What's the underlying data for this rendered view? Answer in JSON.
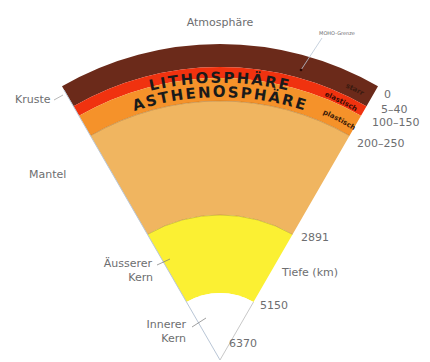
{
  "colors": {
    "crust_starr": "#6b2a1a",
    "elastisch": "#f0320f",
    "asthenosphere": "#f5922a",
    "mantel": "#f0b560",
    "outer_core": "#fbf033",
    "inner_core": "#ffffff",
    "label": "#6d6e70",
    "edge_line": "#b9c6d6"
  },
  "labels": {
    "atmosphere": "Atmosphäre",
    "moho": "MOHO-Grenze",
    "lithosphere": "LITHOSPHÄRE",
    "asthenosphere": "ASTHENOSPHÄRE",
    "starr": "starr",
    "elastisch": "elastisch",
    "plastisch": "plastisch",
    "kruste": "Kruste",
    "mantel": "Mantel",
    "outer_core_line1": "Äusserer",
    "outer_core_line2": "Kern",
    "inner_core_line1": "Innerer",
    "inner_core_line2": "Kern",
    "depth_axis": "Tiefe (km)"
  },
  "depths": {
    "surface": "0",
    "moho": "5–40",
    "lithosphere_base": "100–150",
    "asthenosphere_base": "200–250",
    "core_mantle": "2891",
    "inner_core_boundary": "5150",
    "center": "6370"
  }
}
